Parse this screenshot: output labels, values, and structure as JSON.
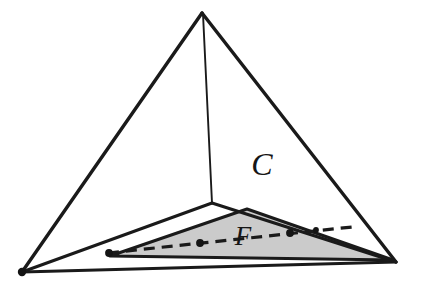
{
  "figure": {
    "background_color": "#ffffff",
    "labels": {
      "cone_label": "C",
      "face_label": "F"
    },
    "colors": {
      "ink": "#1a1a1a",
      "shaded_face": "#cbcbcb",
      "shaded_face_edge": "#1a1a1a",
      "background": "#ffffff",
      "dot": "#141414"
    },
    "geometry": {
      "apex": [
        202,
        13
      ],
      "left_vertex": [
        22,
        272
      ],
      "right_vertex": [
        396,
        262
      ],
      "back_vertex": [
        212,
        203
      ],
      "face_left": [
        110,
        256
      ],
      "face_top": [
        247,
        209
      ],
      "face_right": [
        393,
        260
      ],
      "dashed_left": [
        108,
        253
      ],
      "dashed_right": [
        352,
        227
      ]
    },
    "line_widths": {
      "outer_edge": 3.4,
      "inner_edge": 2.0,
      "face_edge": 3.0,
      "dashed": 3.2
    },
    "dash_pattern": "11 7",
    "marked_points": [
      {
        "name": "base-left-vertex-dot",
        "cx": 22,
        "cy": 272,
        "r": 4.0
      },
      {
        "name": "dashed-line-left-endpoint-dot",
        "cx": 109,
        "cy": 253,
        "r": 3.8
      },
      {
        "name": "dashed-line-mid-dot",
        "cx": 200,
        "cy": 243,
        "r": 3.8
      },
      {
        "name": "dashed-line-right-dot",
        "cx": 290,
        "cy": 233,
        "r": 3.8
      },
      {
        "name": "dashed-line-far-right-dot",
        "cx": 316,
        "cy": 230,
        "r": 3.0
      }
    ],
    "label_positions": {
      "cone_label": {
        "x": 262,
        "y": 175,
        "size": 32
      },
      "face_label": {
        "x": 237,
        "y": 245,
        "size": 27
      }
    }
  }
}
